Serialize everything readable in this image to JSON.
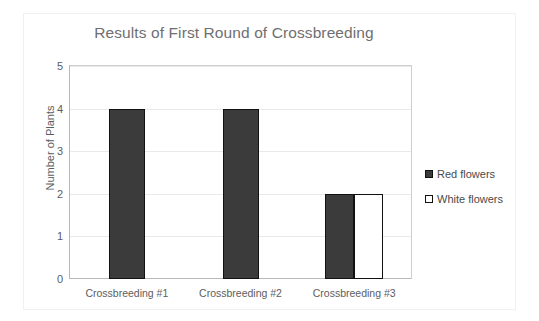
{
  "clipped_text_above": "",
  "chart_data": {
    "type": "bar",
    "title": "Results of First Round of Crossbreeding",
    "xlabel": "",
    "ylabel": "Number of Plants",
    "categories": [
      "Crossbreeding #1",
      "Crossbreeding #2",
      "Crossbreeding #3"
    ],
    "series": [
      {
        "name": "Red flowers",
        "color": "#3b3b3b",
        "values": [
          4,
          4,
          2
        ]
      },
      {
        "name": "White flowers",
        "color": "#ffffff",
        "values": [
          0,
          0,
          2
        ]
      }
    ],
    "ylim": [
      0,
      5
    ],
    "yticks": [
      0,
      1,
      2,
      3,
      4,
      5
    ],
    "ytick_labels": [
      "0",
      "1",
      "2",
      "3",
      "4",
      "5"
    ],
    "grid": true,
    "legend_position": "right"
  },
  "legend": {
    "items": [
      {
        "label": "Red flowers",
        "swatch": "red-filled-square-icon"
      },
      {
        "label": "White flowers",
        "swatch": "white-square-icon"
      }
    ]
  }
}
